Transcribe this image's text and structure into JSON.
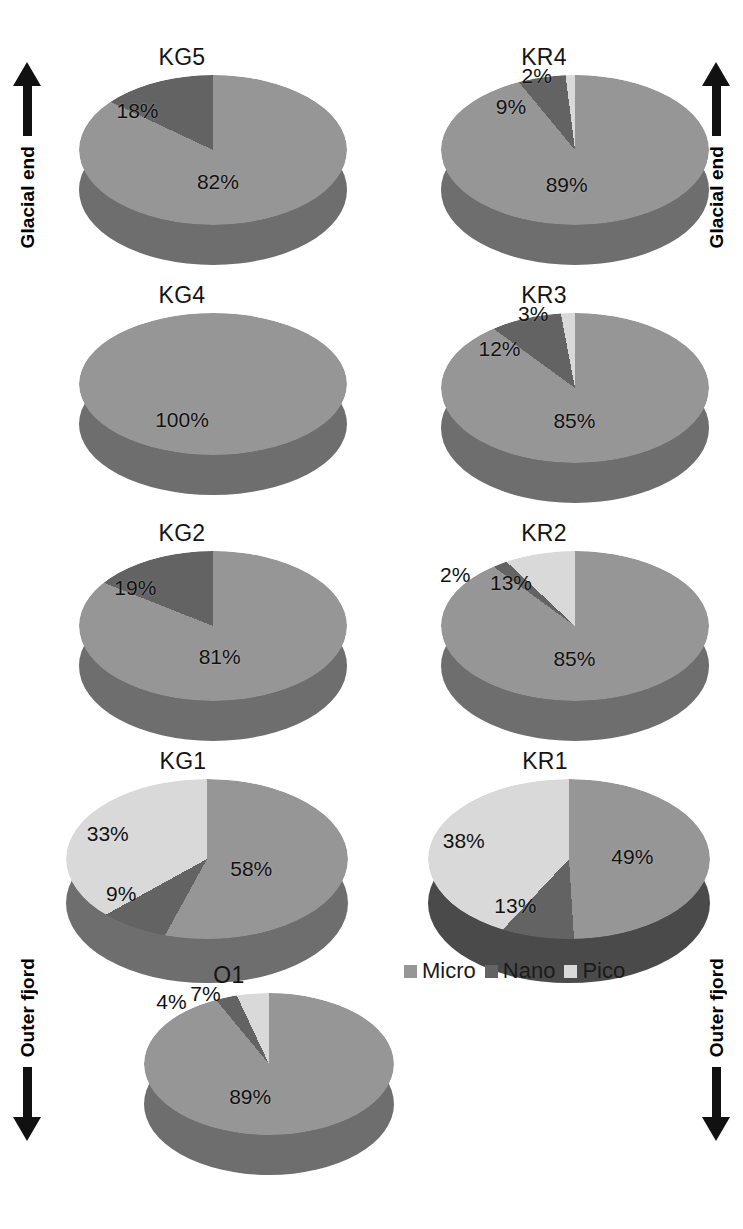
{
  "axes": {
    "left": {
      "top_label": "Glacial end",
      "bottom_label": "Outer fjord",
      "top_arrow": "arrow-up-icon",
      "bottom_arrow": "arrow-down-icon"
    },
    "right": {
      "top_label": "Glacial end",
      "bottom_label": "Outer fjord",
      "top_arrow": "arrow-up-icon",
      "bottom_arrow": "arrow-down-icon"
    }
  },
  "legend": {
    "position": "bottom-right",
    "entries": [
      {
        "label": "Micro",
        "color": "#969696"
      },
      {
        "label": "Nano",
        "color": "#636363"
      },
      {
        "label": "Pico",
        "color": "#d9d9d9"
      }
    ]
  },
  "colors": {
    "micro": "#969696",
    "nano": "#636363",
    "pico": "#d9d9d9",
    "micro_side": "#6e6e6e",
    "nano_side": "#4a4a4a",
    "pico_side": "#a8a8a8",
    "text": "#111111"
  },
  "charts": [
    {
      "title": "KG5",
      "labels": [
        "82%",
        "18%"
      ],
      "values": [
        82,
        18,
        0
      ],
      "series": [
        "Micro",
        "Nano",
        "Pico"
      ]
    },
    {
      "title": "KR4",
      "labels": [
        "89%",
        "9%",
        "2%"
      ],
      "values": [
        89,
        9,
        2
      ],
      "series": [
        "Micro",
        "Nano",
        "Pico"
      ]
    },
    {
      "title": "KG4",
      "labels": [
        "100%"
      ],
      "values": [
        100,
        0,
        0
      ],
      "series": [
        "Micro",
        "Nano",
        "Pico"
      ]
    },
    {
      "title": "KR3",
      "labels": [
        "85%",
        "12%",
        "3%"
      ],
      "values": [
        85,
        12,
        3
      ],
      "series": [
        "Micro",
        "Nano",
        "Pico"
      ]
    },
    {
      "title": "KG2",
      "labels": [
        "81%",
        "19%"
      ],
      "values": [
        81,
        19,
        0
      ],
      "series": [
        "Micro",
        "Nano",
        "Pico"
      ]
    },
    {
      "title": "KR2",
      "labels": [
        "85%",
        "2%",
        "13%"
      ],
      "values": [
        85,
        2,
        13
      ],
      "series": [
        "Micro",
        "Nano",
        "Pico"
      ]
    },
    {
      "title": "KG1",
      "labels": [
        "58%",
        "9%",
        "33%"
      ],
      "values": [
        58,
        9,
        33
      ],
      "series": [
        "Micro",
        "Nano",
        "Pico"
      ]
    },
    {
      "title": "KR1",
      "labels": [
        "49%",
        "13%",
        "38%"
      ],
      "values": [
        49,
        13,
        38
      ],
      "series": [
        "Micro",
        "Nano",
        "Pico"
      ]
    },
    {
      "title": "O1",
      "labels": [
        "89%",
        "4%",
        "7%"
      ],
      "values": [
        89,
        4,
        7
      ],
      "series": [
        "Micro",
        "Nano",
        "Pico"
      ]
    }
  ],
  "chart_data": {
    "type": "pie",
    "title": "",
    "subtitle": "",
    "legend_entries": [
      "Micro",
      "Nano",
      "Pico"
    ],
    "legend_position": "bottom-right",
    "units": "percent",
    "annotations": [
      "Glacial end",
      "Outer fjord"
    ],
    "categories": [
      "Micro",
      "Nano",
      "Pico"
    ],
    "panels": [
      {
        "name": "KG5",
        "values": [
          82,
          18,
          0
        ],
        "labels": [
          "82%",
          "18%"
        ]
      },
      {
        "name": "KR4",
        "values": [
          89,
          9,
          2
        ],
        "labels": [
          "89%",
          "9%",
          "2%"
        ]
      },
      {
        "name": "KG4",
        "values": [
          100,
          0,
          0
        ],
        "labels": [
          "100%"
        ]
      },
      {
        "name": "KR3",
        "values": [
          85,
          12,
          3
        ],
        "labels": [
          "85%",
          "12%",
          "3%"
        ]
      },
      {
        "name": "KG2",
        "values": [
          81,
          19,
          0
        ],
        "labels": [
          "81%",
          "19%"
        ]
      },
      {
        "name": "KR2",
        "values": [
          85,
          2,
          13
        ],
        "labels": [
          "85%",
          "2%",
          "13%"
        ]
      },
      {
        "name": "KG1",
        "values": [
          58,
          9,
          33
        ],
        "labels": [
          "58%",
          "9%",
          "33%"
        ]
      },
      {
        "name": "KR1",
        "values": [
          49,
          13,
          38
        ],
        "labels": [
          "49%",
          "13%",
          "38%"
        ]
      },
      {
        "name": "O1",
        "values": [
          89,
          4,
          7
        ],
        "labels": [
          "89%",
          "4%",
          "7%"
        ]
      }
    ]
  }
}
